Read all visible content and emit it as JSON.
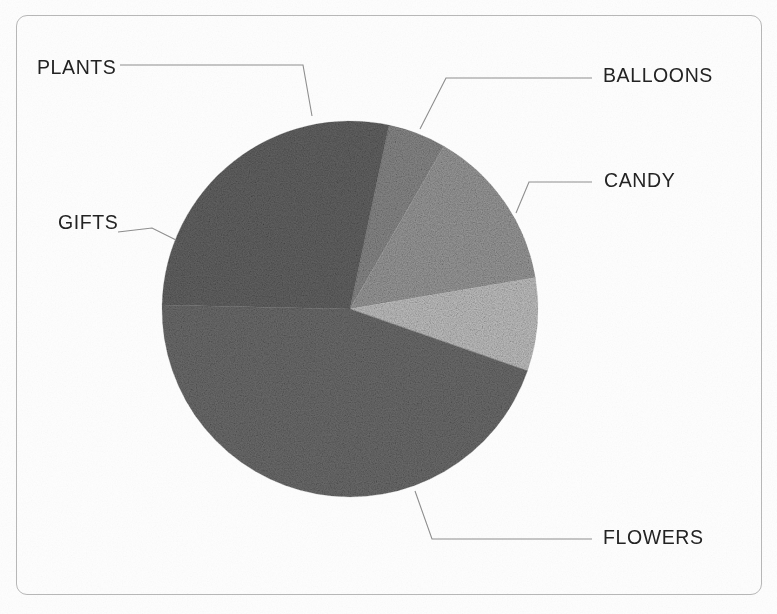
{
  "frame": {
    "border_color": "#b9b9b9",
    "background": "#fefefe"
  },
  "chart_data": {
    "type": "pie",
    "title": "",
    "categories": [
      "PLANTS",
      "BALLOONS",
      "CANDY",
      "FLOWERS",
      "GIFTS"
    ],
    "values": [
      5,
      14,
      8,
      45,
      28
    ],
    "units": "percent",
    "total": 100,
    "legend": "callout-labels",
    "labels_shown": true,
    "values_shown": false,
    "grid": false,
    "slice_colors": [
      "#8b8b8b",
      "#9c9c9c",
      "#c4c4c4",
      "#6e6e6e",
      "#656565"
    ],
    "start_angle_deg": -78,
    "direction": "clockwise",
    "center": {
      "x": 350,
      "y": 309
    },
    "radius": 188,
    "slices": [
      {
        "label": "PLANTS",
        "value": 5,
        "color": "#8b8b8b",
        "start_deg": -78.0,
        "end_deg": -60.0
      },
      {
        "label": "BALLOONS",
        "value": 14,
        "color": "#9c9c9c",
        "start_deg": -60.0,
        "end_deg": -9.6
      },
      {
        "label": "CANDY",
        "value": 8,
        "color": "#c4c4c4",
        "start_deg": -9.6,
        "end_deg": 19.2
      },
      {
        "label": "FLOWERS",
        "value": 45,
        "color": "#6e6e6e",
        "start_deg": 19.2,
        "end_deg": 181.2
      },
      {
        "label": "GIFTS",
        "value": 28,
        "color": "#656565",
        "start_deg": 181.2,
        "end_deg": 282.0
      }
    ]
  },
  "labels": {
    "plants": "PLANTS",
    "balloons": "BALLOONS",
    "candy": "CANDY",
    "gifts": "GIFTS",
    "flowers": "FLOWERS"
  },
  "leader_lines": {
    "color": "#8f8f8f",
    "plants": "120,65 303,65 312,116",
    "balloons": "592,78 446,78 420,129",
    "candy": "592,182 529,182 516,213",
    "gifts": "118,232 152,228 176,240",
    "flowers": "592,539 432,539 415,491"
  }
}
